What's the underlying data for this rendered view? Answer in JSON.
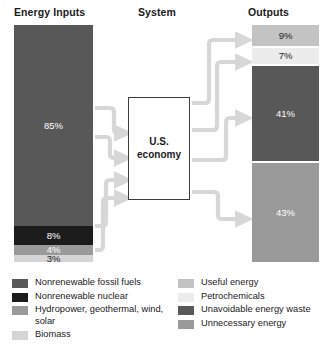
{
  "headings": {
    "inputs": "Energy Inputs",
    "system": "System",
    "outputs": "Outputs"
  },
  "system_box": {
    "line1": "U.S.",
    "line2": "economy"
  },
  "chart_data": {
    "type": "bar",
    "subtype": "sankey-style flow diagram",
    "input_bar": {
      "label": "Energy Inputs",
      "total": 100,
      "unit": "%",
      "segments": [
        {
          "label": "85%",
          "value": 85,
          "category": "Nonrenewable fossil fuels",
          "color": "#585858",
          "text_color": "light"
        },
        {
          "label": "8%",
          "value": 8,
          "category": "Nonrenewable nuclear",
          "color": "#1c1c1c",
          "text_color": "light"
        },
        {
          "label": "4%",
          "value": 4,
          "category": "Hydropower, geothermal, wind, solar",
          "color": "#9a9a9a",
          "text_color": "light"
        },
        {
          "label": "3%",
          "value": 3,
          "category": "Biomass",
          "color": "#d5d5d5",
          "text_color": "dark"
        }
      ]
    },
    "output_bar": {
      "label": "Outputs",
      "total": 100,
      "unit": "%",
      "segments": [
        {
          "label": "9%",
          "value": 9,
          "category": "Useful energy",
          "color": "#c3c3c3",
          "text_color": "dark"
        },
        {
          "label": "7%",
          "value": 7,
          "category": "Petrochemicals",
          "color": "#ececec",
          "text_color": "dark"
        },
        {
          "label": "41%",
          "value": 41,
          "category": "Unavoidable energy waste",
          "color": "#585858",
          "text_color": "light"
        },
        {
          "label": "43%",
          "value": 43,
          "category": "Unnecessary energy",
          "color": "#9a9a9a",
          "text_color": "light"
        }
      ]
    },
    "flow_color": "#d7d7d7",
    "legend_position": "bottom"
  },
  "legend": {
    "left_column": [
      {
        "color": "#585858",
        "label": "Nonrenewable fossil fuels"
      },
      {
        "color": "#1c1c1c",
        "label": "Nonrenewable nuclear"
      },
      {
        "color": "#9a9a9a",
        "label": "Hydropower, geothermal, wind, solar"
      },
      {
        "color": "#d5d5d5",
        "label": "Biomass"
      }
    ],
    "right_column": [
      {
        "color": "#c3c3c3",
        "label": "Useful energy"
      },
      {
        "color": "#ececec",
        "label": "Petrochemicals"
      },
      {
        "color": "#585858",
        "label": "Unavoidable energy waste"
      },
      {
        "color": "#9a9a9a",
        "label": "Unnecessary energy"
      }
    ]
  },
  "caption": ""
}
